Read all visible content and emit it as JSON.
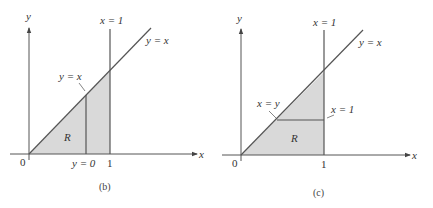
{
  "colors": {
    "line": "#555555",
    "fill": "#d9d9d9",
    "text": "#333333"
  },
  "panels": [
    {
      "id": "b",
      "caption": "(b)",
      "axis_x_label": "x",
      "axis_y_label": "y",
      "origin_label": "0",
      "tick_label_1": "1",
      "vertical_line_label": "x = 1",
      "diagonal_label": "y = x",
      "inner_upper_label": "y = x",
      "inner_lower_label": "y = 0",
      "region_label": "R"
    },
    {
      "id": "c",
      "caption": "(c)",
      "axis_x_label": "x",
      "axis_y_label": "y",
      "origin_label": "0",
      "tick_label_1": "1",
      "vertical_line_label": "x = 1",
      "diagonal_label": "y = x",
      "inner_left_label": "x = y",
      "inner_right_label": "x = 1",
      "region_label": "R"
    }
  ]
}
